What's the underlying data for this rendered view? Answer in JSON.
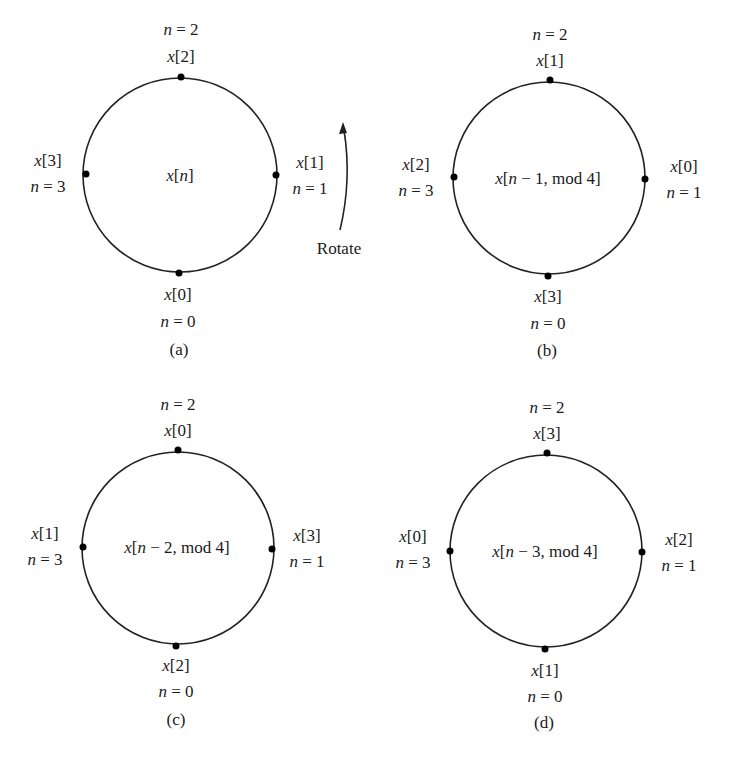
{
  "figure": {
    "rotate_label": "Rotate",
    "panels": [
      {
        "id": "a",
        "caption": "(a)",
        "center_expr": [
          "x",
          "[",
          "n",
          "]",
          "",
          ""
        ],
        "center_label": "x[n]",
        "cx": 180,
        "cy": 175,
        "r": 96,
        "points": [
          {
            "pos": "top",
            "value": "x[2]",
            "n": "n = 2",
            "idx": "2",
            "nval": "2"
          },
          {
            "pos": "right",
            "value": "x[1]",
            "n": "n = 1",
            "idx": "1",
            "nval": "1"
          },
          {
            "pos": "bottom",
            "value": "x[0]",
            "n": "n = 0",
            "idx": "0",
            "nval": "0"
          },
          {
            "pos": "left",
            "value": "x[3]",
            "n": "n = 3",
            "idx": "3",
            "nval": "3"
          }
        ]
      },
      {
        "id": "b",
        "caption": "(b)",
        "center_label": "x[n − 1, mod 4]",
        "center_rest": " − 1, mod 4]",
        "cx": 549,
        "cy": 178,
        "r": 96,
        "points": [
          {
            "pos": "top",
            "value": "x[1]",
            "n": "n = 2",
            "idx": "1",
            "nval": "2"
          },
          {
            "pos": "right",
            "value": "x[0]",
            "n": "n = 1",
            "idx": "0",
            "nval": "1"
          },
          {
            "pos": "bottom",
            "value": "x[3]",
            "n": "n = 0",
            "idx": "3",
            "nval": "0"
          },
          {
            "pos": "left",
            "value": "x[2]",
            "n": "n = 3",
            "idx": "2",
            "nval": "3"
          }
        ]
      },
      {
        "id": "c",
        "caption": "(c)",
        "center_label": "x[n − 2, mod 4]",
        "center_rest": " − 2, mod 4]",
        "cx": 178,
        "cy": 548,
        "r": 96,
        "points": [
          {
            "pos": "top",
            "value": "x[0]",
            "n": "n = 2",
            "idx": "0",
            "nval": "2"
          },
          {
            "pos": "right",
            "value": "x[3]",
            "n": "n = 1",
            "idx": "3",
            "nval": "1"
          },
          {
            "pos": "bottom",
            "value": "x[2]",
            "n": "n = 0",
            "idx": "2",
            "nval": "0"
          },
          {
            "pos": "left",
            "value": "x[1]",
            "n": "n = 3",
            "idx": "1",
            "nval": "3"
          }
        ]
      },
      {
        "id": "d",
        "caption": "(d)",
        "center_label": "x[n − 3, mod 4]",
        "center_rest": " − 3, mod 4]",
        "cx": 546,
        "cy": 551,
        "r": 96,
        "points": [
          {
            "pos": "top",
            "value": "x[3]",
            "n": "n = 2",
            "idx": "3",
            "nval": "2"
          },
          {
            "pos": "right",
            "value": "x[2]",
            "n": "n = 1",
            "idx": "2",
            "nval": "1"
          },
          {
            "pos": "bottom",
            "value": "x[1]",
            "n": "n = 0",
            "idx": "1",
            "nval": "0"
          },
          {
            "pos": "left",
            "value": "x[0]",
            "n": "n = 3",
            "idx": "0",
            "nval": "3"
          }
        ]
      }
    ]
  }
}
